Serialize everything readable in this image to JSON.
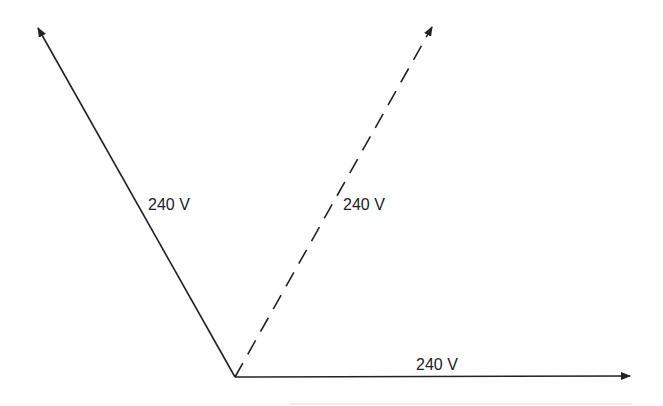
{
  "diagram": {
    "type": "phasor diagram",
    "vectors": [
      {
        "id": "left",
        "label": "240 V",
        "style": "solid",
        "from": [
          235,
          377
        ],
        "to": [
          38,
          28
        ]
      },
      {
        "id": "dashed",
        "label": "240 V",
        "style": "dashed",
        "from": [
          235,
          377
        ],
        "to": [
          432,
          27
        ]
      },
      {
        "id": "horizontal",
        "label": "240 V",
        "style": "solid",
        "from": [
          235,
          377
        ],
        "to": [
          630,
          376
        ]
      }
    ],
    "colors": {
      "line": "#222222",
      "background": "#ffffff"
    }
  }
}
